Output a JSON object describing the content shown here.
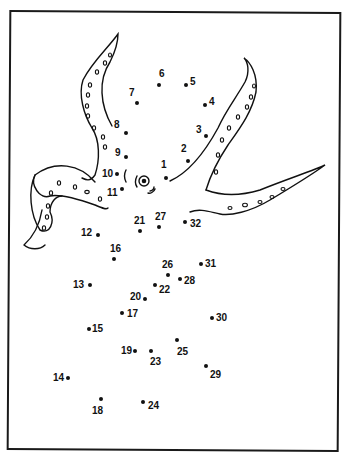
{
  "puzzle": {
    "type": "connect-the-dots",
    "subject": "octopus",
    "ink_color": "#111111",
    "paper_color": "#ffffff",
    "dots": [
      {
        "n": "1",
        "x": 166,
        "y": 178,
        "lx": 161,
        "ly": 160
      },
      {
        "n": "2",
        "x": 188,
        "y": 161,
        "lx": 181,
        "ly": 144
      },
      {
        "n": "3",
        "x": 206,
        "y": 136,
        "lx": 196,
        "ly": 125
      },
      {
        "n": "4",
        "x": 205,
        "y": 105,
        "lx": 209,
        "ly": 97
      },
      {
        "n": "5",
        "x": 186,
        "y": 85,
        "lx": 190,
        "ly": 77
      },
      {
        "n": "6",
        "x": 159,
        "y": 85,
        "lx": 159,
        "ly": 69
      },
      {
        "n": "7",
        "x": 137,
        "y": 103,
        "lx": 129,
        "ly": 88
      },
      {
        "n": "8",
        "x": 126,
        "y": 133,
        "lx": 114,
        "ly": 120
      },
      {
        "n": "9",
        "x": 126,
        "y": 157,
        "lx": 115,
        "ly": 148
      },
      {
        "n": "10",
        "x": 117,
        "y": 174,
        "lx": 102,
        "ly": 169
      },
      {
        "n": "11",
        "x": 122,
        "y": 189,
        "lx": 107,
        "ly": 188
      },
      {
        "n": "12",
        "x": 98,
        "y": 235,
        "lx": 81,
        "ly": 228
      },
      {
        "n": "13",
        "x": 90,
        "y": 285,
        "lx": 73,
        "ly": 280
      },
      {
        "n": "14",
        "x": 68,
        "y": 378,
        "lx": 53,
        "ly": 373
      },
      {
        "n": "15",
        "x": 89,
        "y": 329,
        "lx": 92,
        "ly": 324
      },
      {
        "n": "16",
        "x": 114,
        "y": 259,
        "lx": 110,
        "ly": 244
      },
      {
        "n": "17",
        "x": 122,
        "y": 313,
        "lx": 127,
        "ly": 309
      },
      {
        "n": "18",
        "x": 101,
        "y": 399,
        "lx": 92,
        "ly": 406
      },
      {
        "n": "19",
        "x": 135,
        "y": 351,
        "lx": 121,
        "ly": 346
      },
      {
        "n": "20",
        "x": 145,
        "y": 299,
        "lx": 130,
        "ly": 292
      },
      {
        "n": "21",
        "x": 140,
        "y": 231,
        "lx": 134,
        "ly": 216
      },
      {
        "n": "22",
        "x": 155,
        "y": 285,
        "lx": 159,
        "ly": 285
      },
      {
        "n": "23",
        "x": 151,
        "y": 351,
        "lx": 150,
        "ly": 357
      },
      {
        "n": "24",
        "x": 143,
        "y": 402,
        "lx": 148,
        "ly": 401
      },
      {
        "n": "25",
        "x": 177,
        "y": 340,
        "lx": 177,
        "ly": 347
      },
      {
        "n": "26",
        "x": 168,
        "y": 275,
        "lx": 162,
        "ly": 260
      },
      {
        "n": "27",
        "x": 159,
        "y": 227,
        "lx": 155,
        "ly": 212
      },
      {
        "n": "28",
        "x": 180,
        "y": 279,
        "lx": 184,
        "ly": 276
      },
      {
        "n": "29",
        "x": 206,
        "y": 366,
        "lx": 210,
        "ly": 370
      },
      {
        "n": "30",
        "x": 212,
        "y": 318,
        "lx": 216,
        "ly": 313
      },
      {
        "n": "31",
        "x": 201,
        "y": 264,
        "lx": 205,
        "ly": 259
      },
      {
        "n": "32",
        "x": 185,
        "y": 222,
        "lx": 190,
        "ly": 219
      }
    ]
  }
}
